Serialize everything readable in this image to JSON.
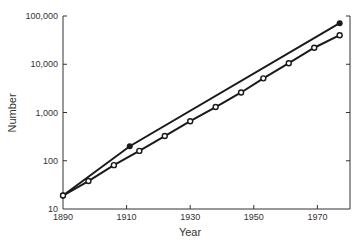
{
  "chart_data": {
    "type": "line",
    "title": "",
    "xlabel": "Year",
    "ylabel": "Number",
    "yscale": "log",
    "xlim": [
      1890,
      1980
    ],
    "ylim": [
      10,
      100000
    ],
    "grid": false,
    "legend": null,
    "x_ticks": [
      1890,
      1910,
      1930,
      1950,
      1970
    ],
    "x_tick_labels": [
      "1890",
      "1910",
      "1930",
      "1950",
      "1970"
    ],
    "y_ticks": [
      10,
      100,
      1000,
      10000,
      100000
    ],
    "y_tick_labels": [
      "10",
      "100",
      "1,000",
      "10,000",
      "100,000"
    ],
    "series": [
      {
        "name": "filled-marker series",
        "marker": "filled-circle",
        "x": [
          1890,
          1911,
          1977
        ],
        "values": [
          19,
          200,
          71000
        ]
      },
      {
        "name": "open-marker series",
        "marker": "open-circle",
        "x": [
          1890,
          1898,
          1906,
          1914,
          1922,
          1930,
          1938,
          1946,
          1953,
          1961,
          1969,
          1977
        ],
        "values": [
          19,
          38,
          81,
          160,
          325,
          660,
          1300,
          2600,
          5100,
          10500,
          22000,
          40000
        ]
      }
    ]
  }
}
